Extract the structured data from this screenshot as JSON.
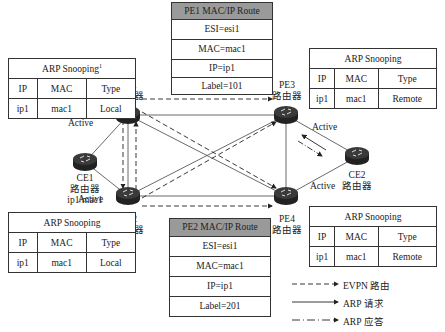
{
  "arp_tables": {
    "pe1": {
      "title": "ARP Snooping",
      "superscript": "1",
      "headers": [
        "IP",
        "MAC",
        "Type"
      ],
      "row": [
        "ip1",
        "mac1",
        "Local"
      ]
    },
    "pe3": {
      "title": "ARP Snooping",
      "headers": [
        "IP",
        "MAC",
        "Type"
      ],
      "row": [
        "ip1",
        "mac1",
        "Remote"
      ]
    },
    "pe2": {
      "title": "ARP Snooping",
      "headers": [
        "IP",
        "MAC",
        "Type"
      ],
      "row": [
        "ip1",
        "mac1",
        "Local"
      ]
    },
    "pe4": {
      "title": "ARP Snooping",
      "headers": [
        "IP",
        "MAC",
        "Type"
      ],
      "row": [
        "ip1",
        "mac1",
        "Remote"
      ]
    }
  },
  "routes": {
    "pe1": {
      "title": "PE1 MAC/IP Route",
      "esi": "ESI=esi1",
      "mac": "MAC=mac1",
      "ip": "IP=ip1",
      "label": "Label=101",
      "header_color": "#9a9a9a"
    },
    "pe2": {
      "title": "PE2 MAC/IP Route",
      "esi": "ESI=esi1",
      "mac": "MAC=mac1",
      "ip": "IP=ip1",
      "label": "Label=201",
      "header_color": "#9a9a9a"
    }
  },
  "nodes": {
    "pe1": {
      "name": "PE1",
      "type": "路由器"
    },
    "pe2": {
      "name": "PE2",
      "type": "路由器"
    },
    "pe3": {
      "name": "PE3",
      "type": "路由器"
    },
    "pe4": {
      "name": "PE4",
      "type": "路由器"
    },
    "ce1": {
      "name": "CE1",
      "type": "路由器",
      "addr": "ip1/mac1"
    },
    "ce2": {
      "name": "CE2",
      "type": "路由器"
    }
  },
  "links": {
    "active": "Active"
  },
  "legend": {
    "evpn": "EVPN 路由",
    "arp_req": "ARP 请求",
    "arp_resp": "ARP 应答"
  }
}
